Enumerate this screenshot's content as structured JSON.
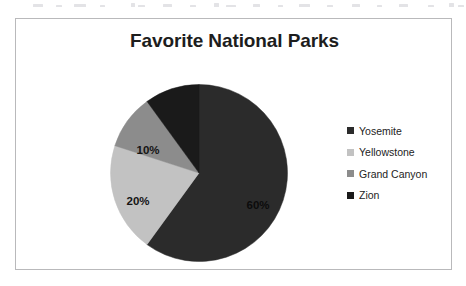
{
  "chart_data": {
    "type": "pie",
    "title": "Favorite National Parks",
    "categories": [
      "Yosemite",
      "Yellowstone",
      "Grand Canyon",
      "Zion"
    ],
    "values": [
      60,
      20,
      10,
      10
    ],
    "data_labels": [
      "60%",
      "20%",
      "10%",
      ""
    ],
    "colors": [
      "#2b2b2b",
      "#c2c2c2",
      "#8c8c8c",
      "#1a1a1a"
    ],
    "legend_position": "right",
    "start_angle_oclock": 12,
    "direction": "clockwise",
    "grid": false,
    "xlabel": "",
    "ylabel": ""
  },
  "figure": {
    "title": "Favorite National Parks",
    "border_color": "#b9b9bb",
    "background": "#ffffff"
  },
  "slices": [
    {
      "name": "Yosemite",
      "value": 60,
      "label": "60%",
      "color": "#2b2b2b",
      "label_x": 148,
      "label_y": 121,
      "label_tone": "on-dark"
    },
    {
      "name": "Yellowstone",
      "value": 20,
      "label": "20%",
      "color": "#c2c2c2",
      "label_x": 28,
      "label_y": 117,
      "label_tone": "on-light"
    },
    {
      "name": "Grand Canyon",
      "value": 10,
      "label": "10%",
      "color": "#8c8c8c",
      "label_x": 38,
      "label_y": 66,
      "label_tone": "on-light"
    },
    {
      "name": "Zion",
      "value": 10,
      "label": "",
      "color": "#1a1a1a",
      "label_x": 0,
      "label_y": 0,
      "label_tone": "on-dark"
    }
  ],
  "legend": {
    "items": [
      {
        "label": "Yosemite",
        "color": "#2b2b2b",
        "swatch_icon": "legend-swatch-square"
      },
      {
        "label": "Yellowstone",
        "color": "#c2c2c2",
        "swatch_icon": "legend-swatch-square"
      },
      {
        "label": "Grand Canyon",
        "color": "#8c8c8c",
        "swatch_icon": "legend-swatch-square"
      },
      {
        "label": "Zion",
        "color": "#1a1a1a",
        "swatch_icon": "legend-swatch-square"
      }
    ]
  }
}
